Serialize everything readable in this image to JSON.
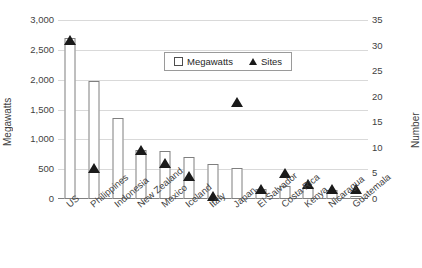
{
  "chart_data": {
    "type": "bar",
    "title": "",
    "subtitle": "",
    "xlabel": "",
    "ylabel": "Megawatts",
    "y2label": "Number",
    "categories": [
      "US",
      "Philippines",
      "Indonesia",
      "New Zealand",
      "Mexico",
      "Iceland",
      "Italy",
      "Japan",
      "El Salvador",
      "Costa Rica",
      "Kenya",
      "Nicaragua",
      "Guatemala"
    ],
    "series": [
      {
        "name": "Megawatts",
        "type": "bar",
        "axis": "left",
        "values": [
          2700,
          1980,
          1360,
          820,
          800,
          710,
          580,
          520,
          160,
          210,
          200,
          150,
          50
        ]
      },
      {
        "name": "Sites",
        "type": "scatter",
        "axis": "right",
        "marker": "triangle",
        "values": [
          31,
          6,
          null,
          9.5,
          7,
          4.5,
          0.5,
          19,
          2,
          5,
          3,
          2,
          2
        ]
      }
    ],
    "ylim": [
      0,
      3000
    ],
    "yticks": [
      0,
      500,
      1000,
      1500,
      2000,
      2500,
      3000
    ],
    "ytick_labels": [
      "0",
      "500",
      "1,000",
      "1,500",
      "2,000",
      "2,500",
      "3,000"
    ],
    "y2lim": [
      0,
      35
    ],
    "y2ticks": [
      0,
      5,
      10,
      15,
      20,
      25,
      30,
      35
    ],
    "y2tick_labels": [
      "0",
      "5",
      "10",
      "15",
      "20",
      "25",
      "30",
      "35"
    ],
    "grid": true,
    "grid_axis": "y",
    "legend": {
      "position": "top-center-inside",
      "entries": [
        {
          "label": "Megawatts",
          "marker": "open-square"
        },
        {
          "label": "Sites",
          "marker": "filled-triangle"
        }
      ]
    },
    "colors": {
      "bar_fill": "#ffffff",
      "bar_border": "#7f7f7f",
      "marker": "#1a1a1a",
      "grid": "#d9d9d9",
      "axis": "#808080",
      "text": "#3f3f3f"
    }
  }
}
